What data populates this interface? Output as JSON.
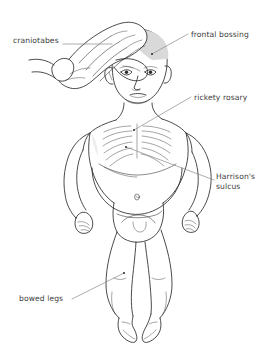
{
  "figure": {
    "background_color": "#ffffff",
    "line_color": "#2b2b2b",
    "leader_color": "#8a8a8a",
    "text_color": "#3b3b3b",
    "shade_color": "#d8d8d8",
    "width": 270,
    "height": 360
  },
  "annotations": [
    {
      "id": "craniotabes",
      "label": "craniotabes",
      "side": "left",
      "target": "examiner hand pressing on skull"
    },
    {
      "id": "frontal-bossing",
      "label": "frontal bossing",
      "side": "right",
      "target": "forehead"
    },
    {
      "id": "rickety-rosary",
      "label": "rickety rosary",
      "side": "right",
      "target": "costochondral junctions of ribs"
    },
    {
      "id": "harrisons-sulcus",
      "label": "Harrison's\nsulcus",
      "side": "right",
      "target": "lower chest groove"
    },
    {
      "id": "bowed-legs",
      "label": "bowed legs",
      "side": "left",
      "target": "lower legs"
    }
  ]
}
